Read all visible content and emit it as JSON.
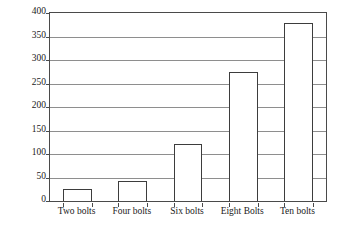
{
  "chart_data": {
    "type": "bar",
    "title": "",
    "xlabel": "",
    "ylabel": "Damage Metric",
    "categories": [
      "Two bolts",
      "Four bolts",
      "Six bolts",
      "Eight Bolts",
      "Ten bolts"
    ],
    "values": [
      25,
      42,
      122,
      275,
      378
    ],
    "ylim": [
      0,
      400
    ],
    "yticks": [
      0,
      50,
      100,
      150,
      200,
      250,
      300,
      350,
      400
    ],
    "ytick_labels": [
      "0",
      "50",
      "100",
      "150",
      "200",
      "250",
      "300",
      "350",
      "400"
    ],
    "grid": true,
    "legend": false,
    "series": [
      {
        "name": "Damage Metric",
        "values": [
          25,
          42,
          122,
          275,
          378
        ]
      }
    ],
    "style": {
      "bar_fill": "#ffffff",
      "bar_edge": "#3d3d3d",
      "gridline_color": "#8e8e8e",
      "frame_color": "#4a4a4a",
      "background": "#ffffff",
      "text_color": "#1a1a1a"
    }
  }
}
